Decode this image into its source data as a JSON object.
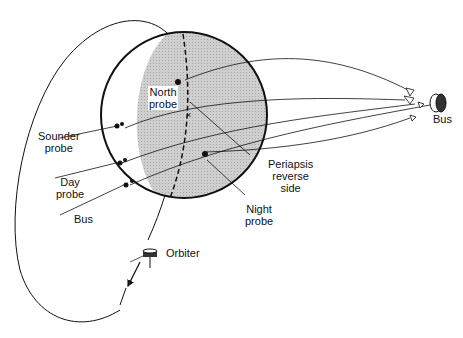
{
  "diagram": {
    "labels": {
      "north_probe": [
        "North",
        "probe"
      ],
      "sounder_probe": [
        "Sounder",
        "probe"
      ],
      "day_probe": [
        "Day",
        "probe"
      ],
      "bus_left": "Bus",
      "bus_right": "Bus",
      "periapsis": [
        "Periapsis",
        "reverse",
        "side"
      ],
      "night_probe": [
        "Night",
        "probe"
      ],
      "orbiter": "Orbiter"
    },
    "colors": {
      "stroke": "#111111",
      "planet_shade": "#c8c8c8",
      "background": "#ffffff"
    }
  }
}
